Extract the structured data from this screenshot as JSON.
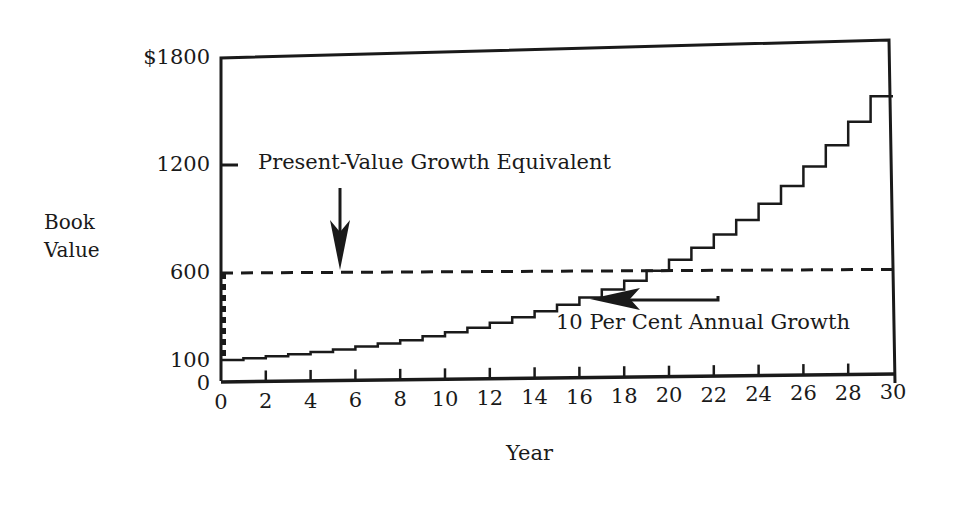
{
  "chart_data": {
    "type": "line",
    "title": "",
    "xlabel": "Year",
    "ylabel": "Book Value",
    "ylabel_lines": [
      "Book",
      "Value"
    ],
    "x_ticks": [
      0,
      2,
      4,
      6,
      8,
      10,
      12,
      14,
      16,
      18,
      20,
      22,
      24,
      26,
      28,
      30
    ],
    "y_ticks": [
      {
        "value": 0,
        "label": "0"
      },
      {
        "value": 100,
        "label": "100"
      },
      {
        "value": 600,
        "label": "600"
      },
      {
        "value": 1200,
        "label": "1200"
      },
      {
        "value": 1800,
        "label": "$1800"
      }
    ],
    "xlim": [
      0,
      30
    ],
    "ylim": [
      0,
      1800
    ],
    "grid": false,
    "legend": "none",
    "series": [
      {
        "name": "10 Per Cent Annual Growth",
        "style": "step-solid",
        "x": [
          0,
          1,
          2,
          3,
          4,
          5,
          6,
          7,
          8,
          9,
          10,
          11,
          12,
          13,
          14,
          15,
          16,
          17,
          18,
          19,
          20,
          21,
          22,
          23,
          24,
          25,
          26,
          27,
          28,
          29,
          30
        ],
        "values": [
          100,
          110,
          121,
          133,
          146,
          161,
          177,
          195,
          214,
          236,
          259,
          285,
          314,
          345,
          380,
          418,
          459,
          505,
          556,
          612,
          673,
          740,
          814,
          895,
          985,
          1083,
          1192,
          1311,
          1442,
          1586,
          1745
        ]
      },
      {
        "name": "Present-Value Growth Equivalent",
        "style": "dashed",
        "x": [
          0,
          30
        ],
        "values": [
          600,
          620
        ]
      }
    ],
    "annotations": [
      {
        "text": "Present-Value Growth Equivalent",
        "points_to": "dashed line near year 5",
        "arrow": "down"
      },
      {
        "text": "10 Per Cent Annual Growth",
        "points_to": "step curve near year 16",
        "arrow": "left"
      }
    ]
  },
  "labels": {
    "ylabel_line1": "Book",
    "ylabel_line2": "Value",
    "xlabel": "Year",
    "annotation_pv": "Present-Value Growth Equivalent",
    "annotation_growth": "10 Per Cent Annual Growth"
  }
}
